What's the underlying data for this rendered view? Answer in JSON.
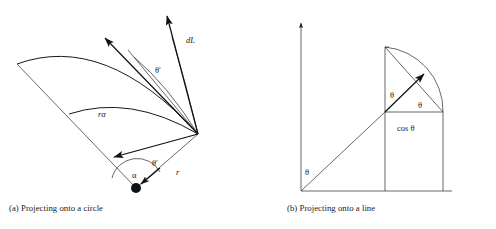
{
  "figure": {
    "background_color": "#ffffff",
    "ink_color": "#1a1a1a",
    "panels": [
      {
        "id": "a",
        "caption": "(a) Projecting onto a circle",
        "labels": {
          "dL": "dL",
          "theta_prime_upper": "θ′",
          "theta_prime_lower": "θ′",
          "r_alpha": "rα",
          "alpha": "α",
          "r": "r"
        }
      },
      {
        "id": "b",
        "caption": "(b) Projecting onto a line",
        "labels": {
          "theta_axis": "θ",
          "theta_vertical": "θ",
          "theta_arc": "θ",
          "cos_theta": "cos θ"
        }
      }
    ]
  },
  "panel_a": {
    "caption": "(a) Projecting onto a circle",
    "label_dL": "dL",
    "label_theta_prime_upper": "θ′",
    "label_theta_prime_lower": "θ′",
    "label_r_alpha": "rα",
    "label_alpha": "α",
    "label_r": "r"
  },
  "panel_b": {
    "caption": "(b) Projecting onto a line",
    "label_theta_axis": "θ",
    "label_theta_vertical": "θ",
    "label_theta_arc": "θ",
    "label_cos_theta": "cos θ"
  }
}
